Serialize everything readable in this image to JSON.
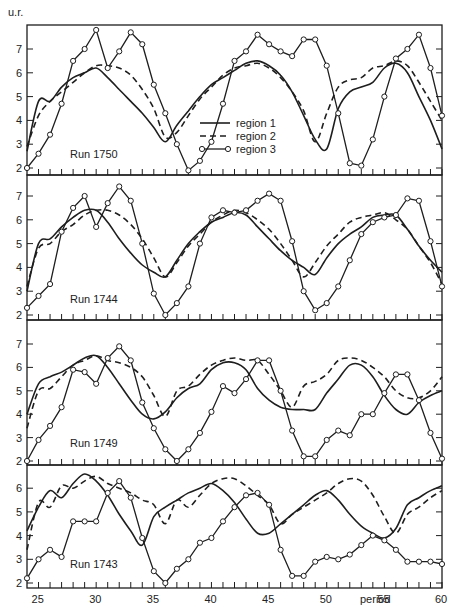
{
  "chart_data": {
    "type": "line",
    "y_unit_label": "u.r.",
    "x_axis": {
      "label": "period",
      "range": [
        24,
        60
      ],
      "ticks": [
        25,
        30,
        35,
        40,
        45,
        50,
        55,
        60
      ]
    },
    "legend": {
      "position": "inside top panel, lower right",
      "entries": [
        {
          "name": "region 1",
          "style": "solid"
        },
        {
          "name": "region 2",
          "style": "dashed"
        },
        {
          "name": "region 3",
          "style": "solid with open circles"
        }
      ]
    },
    "panels": [
      {
        "title": "Run 1750",
        "ylim": [
          2,
          7.9
        ],
        "yticks": [
          2,
          3,
          4,
          5,
          6,
          7
        ],
        "x": [
          24,
          25,
          26,
          27,
          28,
          29,
          30,
          31,
          32,
          33,
          34,
          35,
          36,
          37,
          38,
          39,
          40,
          41,
          42,
          43,
          44,
          45,
          46,
          47,
          48,
          49,
          50,
          51,
          52,
          53,
          54,
          55,
          56,
          57,
          58,
          59,
          60
        ],
        "series": [
          {
            "name": "region 1",
            "values": [
              2.7,
              4.8,
              4.8,
              5.4,
              5.8,
              6.0,
              6.2,
              5.8,
              5.3,
              4.8,
              4.3,
              3.7,
              3.1,
              3.8,
              4.4,
              5.0,
              5.5,
              5.8,
              6.1,
              6.4,
              6.5,
              6.3,
              5.9,
              5.2,
              4.2,
              3.2,
              2.8,
              4.5,
              5.2,
              5.4,
              5.6,
              6.2,
              6.4,
              6.0,
              5.0,
              4.0,
              2.8
            ]
          },
          {
            "name": "region 2",
            "values": [
              2.9,
              4.2,
              4.8,
              5.2,
              5.6,
              6.0,
              6.3,
              6.3,
              6.2,
              5.9,
              5.3,
              4.5,
              3.3,
              3.5,
              4.2,
              4.9,
              5.4,
              5.9,
              6.2,
              6.3,
              6.4,
              6.2,
              5.8,
              5.2,
              4.4,
              3.1,
              4.3,
              5.4,
              5.7,
              5.8,
              6.2,
              6.3,
              6.5,
              6.3,
              5.6,
              4.8,
              4.0
            ]
          },
          {
            "name": "region 3",
            "values": [
              2.0,
              2.6,
              3.4,
              4.7,
              6.5,
              7.0,
              7.8,
              6.2,
              6.9,
              7.7,
              7.2,
              5.5,
              4.3,
              3.0,
              1.9,
              2.3,
              3.1,
              4.7,
              6.5,
              6.9,
              7.6,
              7.2,
              6.9,
              6.7,
              7.4,
              7.4,
              6.3,
              4.3,
              2.2,
              2.1,
              3.2,
              5.0,
              6.6,
              7.0,
              7.6,
              6.2,
              4.2
            ]
          }
        ]
      },
      {
        "title": "Run 1744",
        "ylim": [
          2,
          7.9
        ],
        "yticks": [
          2,
          3,
          4,
          5,
          6,
          7
        ],
        "x": [
          24,
          25,
          26,
          27,
          28,
          29,
          30,
          31,
          32,
          33,
          34,
          35,
          36,
          37,
          38,
          39,
          40,
          41,
          42,
          43,
          44,
          45,
          46,
          47,
          48,
          49,
          50,
          51,
          52,
          53,
          54,
          55,
          56,
          57,
          58,
          59,
          60
        ],
        "series": [
          {
            "name": "region 1",
            "values": [
              3.0,
              5.0,
              5.2,
              5.7,
              6.1,
              6.4,
              6.4,
              5.9,
              5.2,
              4.6,
              4.1,
              3.8,
              3.6,
              4.3,
              5.0,
              5.5,
              5.9,
              6.1,
              6.3,
              6.2,
              5.7,
              5.2,
              4.7,
              4.3,
              4.0,
              3.7,
              4.4,
              5.0,
              5.4,
              5.7,
              6.1,
              6.2,
              6.2,
              5.6,
              4.9,
              4.3,
              3.8
            ]
          },
          {
            "name": "region 2",
            "values": [
              3.2,
              4.8,
              5.0,
              5.5,
              5.8,
              6.2,
              6.4,
              6.4,
              6.2,
              5.8,
              5.2,
              4.4,
              3.6,
              4.2,
              4.9,
              5.4,
              5.9,
              6.2,
              6.4,
              6.3,
              6.0,
              5.6,
              5.0,
              4.3,
              3.6,
              4.2,
              4.9,
              5.4,
              5.9,
              6.1,
              6.2,
              6.3,
              6.0,
              5.6,
              4.9,
              4.2,
              3.3
            ]
          },
          {
            "name": "region 3",
            "values": [
              2.3,
              2.8,
              3.3,
              5.5,
              6.5,
              7.0,
              5.7,
              6.7,
              7.4,
              6.8,
              5.0,
              2.9,
              2.0,
              2.5,
              3.2,
              5.0,
              6.1,
              6.4,
              6.3,
              6.4,
              6.8,
              7.1,
              6.8,
              5.1,
              3.0,
              2.2,
              2.5,
              3.2,
              4.3,
              5.4,
              5.9,
              6.1,
              6.2,
              6.9,
              6.8,
              5.1,
              3.2
            ]
          }
        ]
      },
      {
        "title": "Run 1749",
        "ylim": [
          2,
          7.9
        ],
        "yticks": [
          2,
          3,
          4,
          5,
          6,
          7
        ],
        "x": [
          24,
          25,
          26,
          27,
          28,
          29,
          30,
          31,
          32,
          33,
          34,
          35,
          36,
          37,
          38,
          39,
          40,
          41,
          42,
          43,
          44,
          45,
          46,
          47,
          48,
          49,
          50,
          51,
          52,
          53,
          54,
          55,
          56,
          57,
          58,
          59,
          60
        ],
        "series": [
          {
            "name": "region 1",
            "values": [
              4.0,
              5.3,
              5.6,
              5.8,
              6.1,
              6.4,
              6.5,
              6.0,
              5.3,
              4.6,
              4.0,
              3.8,
              4.1,
              4.7,
              5.1,
              5.3,
              5.9,
              6.2,
              6.2,
              5.9,
              5.1,
              4.6,
              4.3,
              4.2,
              4.2,
              4.2,
              4.9,
              5.5,
              6.1,
              6.1,
              5.6,
              4.8,
              4.2,
              4.0,
              4.5,
              4.8,
              5.0
            ]
          },
          {
            "name": "region 2",
            "values": [
              3.4,
              5.0,
              5.1,
              5.6,
              6.1,
              6.3,
              6.5,
              6.3,
              6.2,
              6.0,
              5.6,
              4.8,
              3.9,
              5.0,
              5.2,
              5.7,
              6.1,
              6.3,
              6.4,
              6.3,
              6.3,
              5.7,
              5.0,
              4.3,
              5.2,
              5.4,
              5.7,
              6.3,
              6.4,
              6.3,
              6.0,
              5.6,
              5.0,
              4.7,
              4.7,
              5.0,
              5.6
            ]
          },
          {
            "name": "region 3",
            "values": [
              2.0,
              2.9,
              3.5,
              4.3,
              5.9,
              5.8,
              5.3,
              6.4,
              6.9,
              6.3,
              4.5,
              3.4,
              2.5,
              2.0,
              2.5,
              3.2,
              4.1,
              5.2,
              4.9,
              5.5,
              6.3,
              6.3,
              5.0,
              3.3,
              2.2,
              2.2,
              2.9,
              3.3,
              3.1,
              4.0,
              4.0,
              4.9,
              5.7,
              5.7,
              4.6,
              3.2,
              2.1
            ]
          }
        ]
      },
      {
        "title": "Run 1743",
        "ylim": [
          1.8,
          6.9
        ],
        "yticks": [
          2,
          3,
          4,
          5,
          6
        ],
        "x": [
          24,
          25,
          26,
          27,
          28,
          29,
          30,
          31,
          32,
          33,
          34,
          35,
          36,
          37,
          38,
          39,
          40,
          41,
          42,
          43,
          44,
          45,
          46,
          47,
          48,
          49,
          50,
          51,
          52,
          53,
          54,
          55,
          56,
          57,
          58,
          59,
          60
        ],
        "series": [
          {
            "name": "region 1",
            "values": [
              4.2,
              5.2,
              5.9,
              5.6,
              6.2,
              6.6,
              6.3,
              5.7,
              4.9,
              4.2,
              3.6,
              4.8,
              5.2,
              5.5,
              5.8,
              6.0,
              6.2,
              5.9,
              5.4,
              4.7,
              4.1,
              4.1,
              4.5,
              4.9,
              5.3,
              5.7,
              5.9,
              5.5,
              4.9,
              4.4,
              4.1,
              3.9,
              4.3,
              5.3,
              5.6,
              5.9,
              6.1
            ]
          },
          {
            "name": "region 2",
            "values": [
              3.4,
              5.4,
              5.2,
              6.1,
              6.0,
              6.3,
              6.5,
              6.2,
              6.0,
              5.8,
              5.5,
              5.3,
              4.5,
              5.5,
              5.2,
              5.7,
              6.2,
              6.4,
              6.4,
              6.1,
              5.7,
              5.3,
              4.5,
              4.9,
              5.2,
              5.5,
              5.8,
              6.2,
              6.4,
              6.3,
              5.7,
              4.8,
              4.1,
              4.9,
              5.2,
              5.6,
              5.9
            ]
          },
          {
            "name": "region 3",
            "values": [
              2.2,
              3.0,
              3.4,
              3.1,
              4.6,
              4.6,
              4.6,
              5.8,
              6.3,
              5.6,
              3.9,
              2.5,
              2.0,
              2.6,
              3.0,
              3.7,
              3.9,
              4.6,
              5.2,
              5.7,
              5.8,
              5.3,
              3.4,
              2.3,
              2.3,
              2.9,
              3.1,
              3.0,
              3.2,
              3.6,
              4.0,
              3.8,
              3.4,
              2.9,
              2.9,
              2.9,
              2.8
            ]
          }
        ]
      }
    ]
  },
  "labels": {
    "y_unit": "u.r.",
    "period": "period",
    "legend": [
      "region 1",
      "region 2",
      "region 3"
    ],
    "runs": [
      "Run 1750",
      "Run 1744",
      "Run 1749",
      "Run 1743"
    ],
    "x_ticks": [
      "25",
      "30",
      "35",
      "40",
      "45",
      "50",
      "55",
      "60"
    ]
  },
  "colors": {
    "ink": "#1e1e1e",
    "background": "#ffffff"
  }
}
